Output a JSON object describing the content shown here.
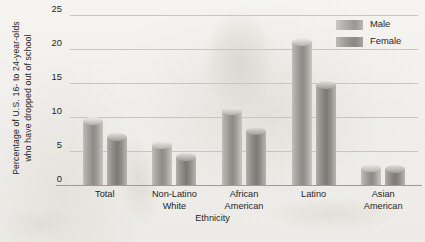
{
  "chart_data": {
    "type": "bar",
    "title": "",
    "xlabel": "Ethnicity",
    "ylabel": "Percentage of U.S. 16- to 24-year-olds who have dropped out of school",
    "ylabel_line1": "Percentage of U.S. 16- to 24-year-olds",
    "ylabel_line2": "who have dropped out of school",
    "categories": [
      "Total",
      "Non-Latino White",
      "African American",
      "Latino",
      "Asian American"
    ],
    "category_lines": [
      [
        "Total"
      ],
      [
        "Non-Latino",
        "White"
      ],
      [
        "African",
        "American"
      ],
      [
        "Latino"
      ],
      [
        "Asian",
        "American"
      ]
    ],
    "series": [
      {
        "name": "Male",
        "color": "#9d9994",
        "values": [
          9.4,
          5.9,
          10.9,
          21.0,
          2.5
        ]
      },
      {
        "name": "Female",
        "color": "#8b8782",
        "values": [
          7.1,
          4.1,
          7.9,
          14.7,
          2.3
        ]
      }
    ],
    "ylim": [
      0,
      25
    ],
    "yticks": [
      0,
      5,
      10,
      15,
      20,
      25
    ],
    "ytick_labels": [
      "0",
      "5",
      "10",
      "15",
      "20",
      "25"
    ],
    "grid": true,
    "legend_position": "top-right",
    "legend": [
      "Male",
      "Female"
    ]
  }
}
